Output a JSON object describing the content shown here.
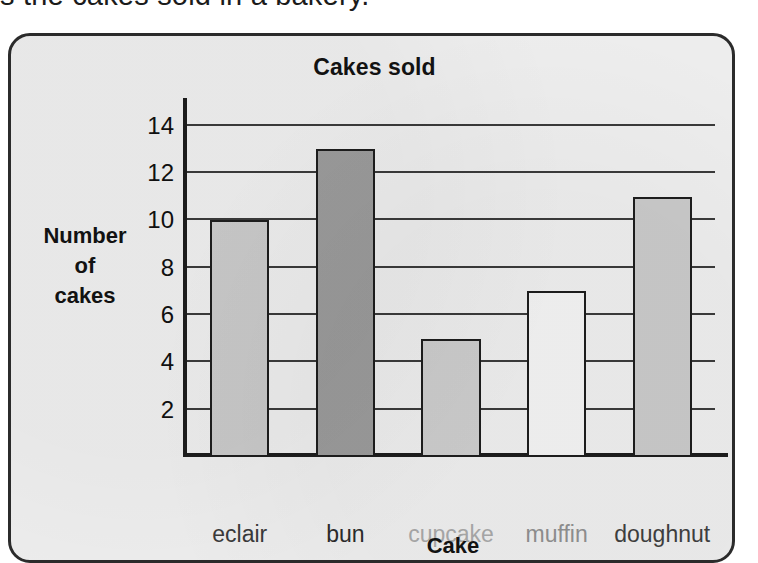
{
  "page": {
    "header_text": "s the cakes sold in a bakery."
  },
  "chart_data": {
    "type": "bar",
    "title": "Cakes sold",
    "xlabel": "Cake",
    "ylabel": "Number of cakes",
    "ylabel_lines": [
      "Number",
      "of",
      "cakes"
    ],
    "categories": [
      "eclair",
      "bun",
      "cupcake",
      "muffin",
      "doughnut"
    ],
    "values": [
      10,
      13,
      5,
      7,
      11
    ],
    "bar_colors": [
      "#c9c9c9",
      "#9b9b9b",
      "#cccccc",
      "#f2f2f2",
      "#c9c9c9"
    ],
    "bar_label_colors": [
      "#3a3a3a",
      "#2b2b2b",
      "#a8a8a8",
      "#8f8f8f",
      "#3f3f3f"
    ],
    "ylim": [
      0,
      15
    ],
    "yticks": [
      2,
      4,
      6,
      8,
      10,
      12,
      14
    ],
    "ytick_labels": [
      "2",
      "4",
      "6",
      "8",
      "10",
      "12",
      "14"
    ],
    "grid": true,
    "legend": "none",
    "plot_background": "#eeeeee",
    "axis_color": "#1d1d1d"
  }
}
